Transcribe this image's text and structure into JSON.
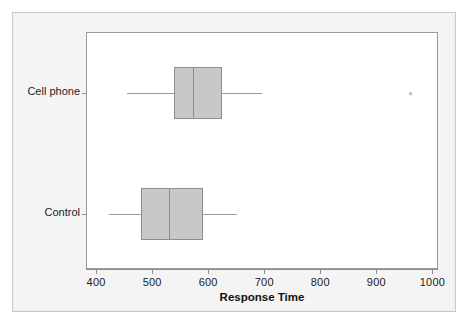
{
  "chart_data": {
    "type": "box",
    "title": "",
    "xlabel": "Response Time",
    "ylabel": "",
    "xlim": [
      382,
      1010
    ],
    "xticks": [
      400,
      500,
      600,
      700,
      800,
      900,
      1000
    ],
    "xtick_labels": [
      "400",
      "500",
      "600",
      "700",
      "800",
      "900",
      "1000"
    ],
    "grid": false,
    "legend": "none",
    "orientation": "horizontal",
    "categories": [
      "Cell phone",
      "Control"
    ],
    "boxes": [
      {
        "name": "Cell phone",
        "whisker_low": 455,
        "q1": 539,
        "median": 573,
        "q3": 624,
        "whisker_high": 696,
        "outliers": [
          961
        ]
      },
      {
        "name": "Control",
        "whisker_low": 423,
        "q1": 481,
        "median": 530,
        "q3": 590,
        "whisker_high": 652,
        "outliers": []
      }
    ],
    "colors": {
      "box_fill": "#c8c8c8",
      "box_edge": "#8d8d8d",
      "whisker": "#9b9b9b",
      "axis": "#8f8f8f",
      "plot_background": "#ffffff",
      "panel_background": "#f2f2f2",
      "text": "#1b1b1b"
    }
  }
}
